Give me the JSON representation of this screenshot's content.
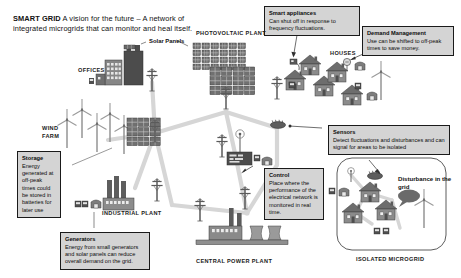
{
  "title": {
    "lead": "SMART GRID",
    "rest": " A vision for the future – A network of integrated microgrids that can monitor and heal itself."
  },
  "colors": {
    "callout_fill": "#d4d4d4",
    "callout_border": "#1a1a1a",
    "grid_line": "#d3d3d3",
    "structure_dark": "#4a4a4a",
    "structure_mid": "#7d7d7d",
    "structure_light": "#b5b5b5",
    "page_background": "#ffffff"
  },
  "callouts": [
    {
      "id": "smart-appliances",
      "heading": "Smart appliances",
      "body": "Can shut off in response to frequency fluctuations."
    },
    {
      "id": "demand-management",
      "heading": "Demand Management",
      "body": "Use can be shifted to off-peak times to save money."
    },
    {
      "id": "sensors",
      "heading": "Sensors",
      "body": "Detect fluctuations and disturbances and can signal for areas to be isolated"
    },
    {
      "id": "control",
      "heading": "Control",
      "body": "Place where the performance of the electrical network is monitored in real time."
    },
    {
      "id": "storage",
      "heading": "Storage",
      "body": "Energy generated at off-peak times could be stored in batteries for later use"
    },
    {
      "id": "generators",
      "heading": "Generators",
      "body": "Energy from small generators and solar panels can reduce overall demand on the grid."
    }
  ],
  "captions": {
    "photovoltaic_plant": "PHOTOVOLTAIC PLANT",
    "offices": "OFFICES",
    "houses": "HOUSES",
    "wind_farm": "WIND FARM",
    "industrial_plant": "INDUSTRIAL PLANT",
    "central_power_plant": "CENTRAL POWER PLANT",
    "isolated_microgrid": "ISOLATED MICROGRID"
  },
  "labels": {
    "solar_panels": "Solar Panels",
    "disturbance": "Disturbance in the grid"
  },
  "icons": {
    "solar_panel": "solar-panel-icon",
    "wind_turbine": "wind-turbine-icon",
    "transmission_tower": "transmission-tower-icon",
    "house": "house-icon",
    "office_building": "office-building-icon",
    "factory": "factory-icon",
    "cooling_tower": "cooling-tower-icon",
    "sensor": "sensor-icon",
    "antenna": "antenna-icon",
    "control_center": "control-center-icon",
    "appliance": "appliance-icon",
    "battery": "battery-icon",
    "speech_bubble": "speech-bubble-icon"
  }
}
